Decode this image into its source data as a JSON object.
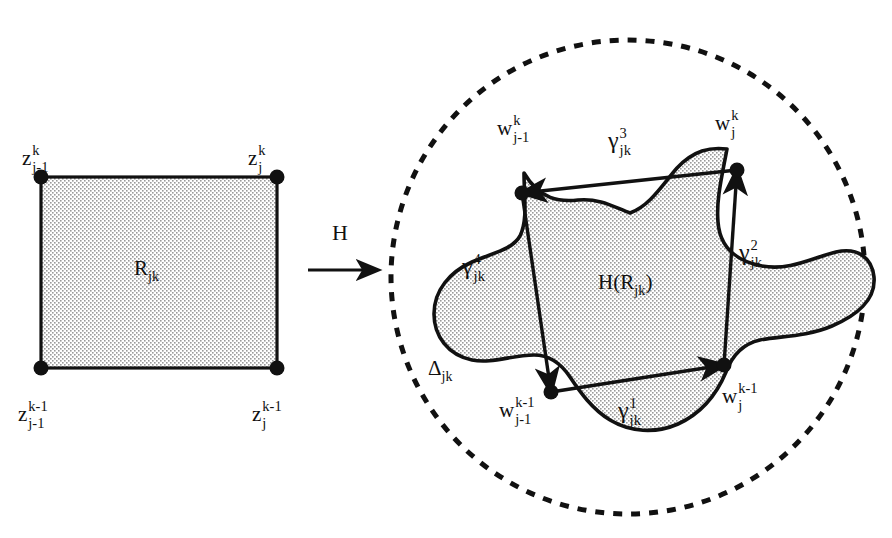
{
  "figure": {
    "colors": {
      "ink": "#111111",
      "stipple_fill": "#e8e8e8",
      "background": "#ffffff"
    }
  },
  "left_panel": {
    "region_label": {
      "base": "R",
      "sub": "jk"
    },
    "corners": [
      {
        "name": "top-left",
        "base": "z",
        "sup": "k",
        "sub": "j-1"
      },
      {
        "name": "top-right",
        "base": "z",
        "sup": "k",
        "sub": "j"
      },
      {
        "name": "bottom-left",
        "base": "z",
        "sup": "k-1",
        "sub": "j-1"
      },
      {
        "name": "bottom-right",
        "base": "z",
        "sup": "k-1",
        "sub": "j"
      }
    ]
  },
  "map_arrow": {
    "label": "H"
  },
  "right_panel": {
    "disk_label": {
      "base": "Δ",
      "sub": "jk"
    },
    "image_label": {
      "prefix": "H(R",
      "sub": "jk",
      "suffix": ")"
    },
    "vertices": [
      {
        "name": "top-left",
        "base": "w",
        "sup": "k",
        "sub": "j-1"
      },
      {
        "name": "top-right",
        "base": "w",
        "sup": "k",
        "sub": "j"
      },
      {
        "name": "bottom-left",
        "base": "w",
        "sup": "k-1",
        "sub": "j-1"
      },
      {
        "name": "bottom-right",
        "base": "w",
        "sup": "k-1",
        "sub": "j"
      }
    ],
    "curves": [
      {
        "name": "gamma-1",
        "base": "γ",
        "sup": "1",
        "sub": "jk",
        "direction": "rightward"
      },
      {
        "name": "gamma-2",
        "base": "γ",
        "sup": "2",
        "sub": "jk",
        "direction": "upward"
      },
      {
        "name": "gamma-3",
        "base": "γ",
        "sup": "3",
        "sub": "jk",
        "direction": "leftward"
      },
      {
        "name": "gamma-4",
        "base": "γ",
        "sup": "4",
        "sub": "jk",
        "direction": "downward"
      }
    ]
  }
}
